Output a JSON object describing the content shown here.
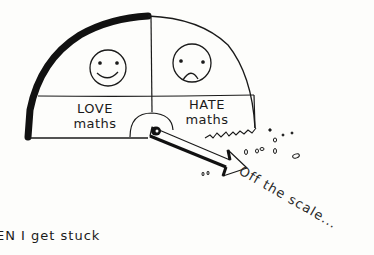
{
  "illustration": {
    "gauge": {
      "left_section": {
        "face": "smiley-face",
        "label_line1": "LOVE",
        "label_line2": "maths"
      },
      "right_section": {
        "face": "sad-face",
        "label_line1": "HATE",
        "label_line2": "maths"
      },
      "needle_direction": "past-right-edge"
    },
    "annotation": "Off the scale...",
    "caption": "EN I get stuck"
  },
  "colors": {
    "ink": "#1a1a1a",
    "paper": "#fdfdfb"
  }
}
